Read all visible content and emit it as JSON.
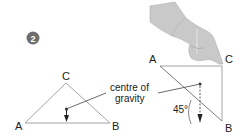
{
  "step_badge": "2",
  "left_triangle": {
    "vertex_a": "A",
    "vertex_b": "B",
    "vertex_c": "C"
  },
  "right_triangle": {
    "vertex_a": "A",
    "vertex_b": "B",
    "vertex_c": "C",
    "angle_label": "45°"
  },
  "annotation": {
    "line1": "centre of",
    "line2": "gravity"
  },
  "colors": {
    "badge": "#6e6e6e",
    "lines": "#8a8a8a",
    "text": "#222222",
    "hand": "#c8c8c8"
  }
}
